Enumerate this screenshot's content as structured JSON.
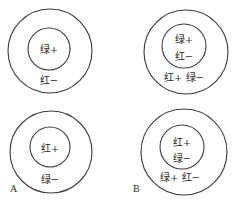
{
  "diagram": {
    "panels": [
      {
        "id": "top-left",
        "center_labels": [
          "绿+"
        ],
        "surround_labels": [
          "红−"
        ]
      },
      {
        "id": "top-right",
        "center_labels": [
          "绿+",
          "红−"
        ],
        "surround_labels": [
          "红+ 绿−"
        ]
      },
      {
        "id": "bottom-left",
        "center_labels": [
          "红+"
        ],
        "surround_labels": [
          "绿−"
        ]
      },
      {
        "id": "bottom-right",
        "center_labels": [
          "红+",
          "绿−"
        ],
        "surround_labels": [
          "绿+ 红−"
        ]
      }
    ],
    "panel_letters": {
      "A": "A",
      "B": "B"
    }
  }
}
